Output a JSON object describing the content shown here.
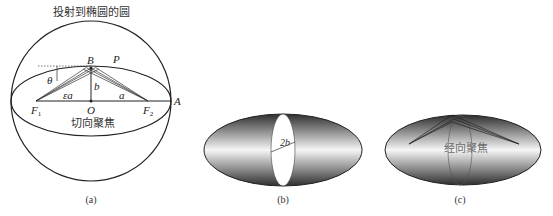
{
  "panels": {
    "a": {
      "title": "投射到椭圆的圆",
      "caption": "(a)",
      "points": {
        "B": "B",
        "P": "P",
        "O": "O",
        "A": "A",
        "F1": "F",
        "F1_sub": "1",
        "F2": "F",
        "F2_sub": "2"
      },
      "labels": {
        "theta": "θ",
        "eps_a": "εa",
        "a": "a",
        "b": "b"
      },
      "focus_text": "切向聚焦"
    },
    "b": {
      "caption": "(b)",
      "diameter_label": "2b"
    },
    "c": {
      "caption": "(c)",
      "focus_text": "经向聚焦"
    }
  },
  "colors": {
    "stroke": "#222222",
    "shade_dark": "#3a3a3a",
    "shade_light": "#f4f4f4",
    "background": "#ffffff"
  }
}
